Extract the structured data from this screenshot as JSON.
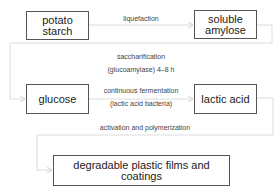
{
  "diagram": {
    "type": "flowchart",
    "nodes": [
      {
        "id": "potato_starch",
        "label_line1": "potato",
        "label_line2": "starch"
      },
      {
        "id": "soluble_amylose",
        "label_line1": "soluble",
        "label_line2": "amylose"
      },
      {
        "id": "glucose",
        "label": "glucose"
      },
      {
        "id": "lactic_acid",
        "label": "lactic acid"
      },
      {
        "id": "degradable_plastic",
        "label": "degradable plastic films and coatings"
      }
    ],
    "edges": [
      {
        "from": "potato_starch",
        "to": "soluble_amylose",
        "label": "liquefaction"
      },
      {
        "from": "soluble_amylose",
        "to": "glucose",
        "label_line1": "saccharification",
        "label_line2": "(glucoamylase) 4–8 h"
      },
      {
        "from": "glucose",
        "to": "lactic_acid",
        "label_line1": "continuous fermentation",
        "label_line2": "(lactic acid bacteria)"
      },
      {
        "from": "lactic_acid",
        "to": "degradable_plastic",
        "label": "activation and polymerization"
      }
    ],
    "colors": {
      "box_border": "#555555",
      "connector": "#d8d8d8",
      "text": "#222222"
    }
  }
}
